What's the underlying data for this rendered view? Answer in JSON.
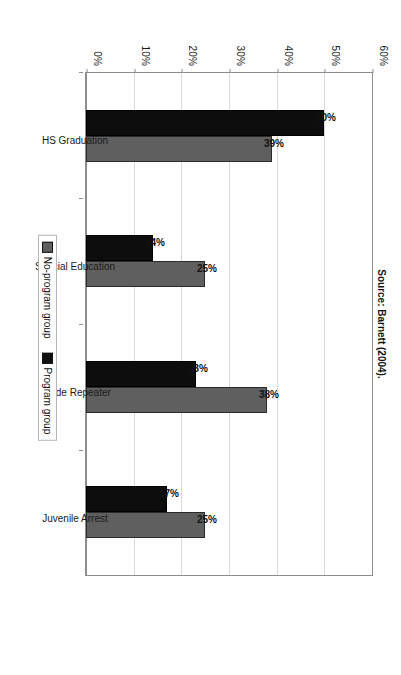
{
  "chart_data": {
    "type": "bar",
    "title": "",
    "subtitle": "",
    "xlabel": "",
    "ylabel": "",
    "ylim": [
      0,
      60
    ],
    "ytick_labels": [
      "0%",
      "10%",
      "20%",
      "30%",
      "40%",
      "50%",
      "60%"
    ],
    "ytick_values": [
      0,
      10,
      20,
      30,
      40,
      50,
      60
    ],
    "grid": true,
    "legend_position": "bottom-center",
    "orientation": "vertical-bars-rotated-90",
    "categories": [
      "HS Graduation",
      "Special Education",
      "Grade Repeater",
      "Juvenile Arrest"
    ],
    "series": [
      {
        "name": "No-program group",
        "color": "#0d0d0d",
        "values": [
          50,
          14,
          23,
          17
        ],
        "labels": [
          "50%",
          "14%",
          "23%",
          "17%"
        ]
      },
      {
        "name": "Program group",
        "color": "#5f5f5f",
        "values": [
          39,
          25,
          38,
          25
        ],
        "labels": [
          "39%",
          "25%",
          "38%",
          "25%"
        ]
      }
    ],
    "annotations": [
      "Source: Barnett (2004)."
    ]
  },
  "figure": {
    "source_note": "Source: Barnett (2004).",
    "legend": {
      "items": [
        {
          "label": "No-program group",
          "swatch": "legend-swatch-no-program"
        },
        {
          "label": "Program group",
          "swatch": "legend-swatch-program"
        }
      ]
    }
  }
}
